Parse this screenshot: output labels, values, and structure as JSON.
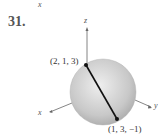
{
  "stray_label": "x",
  "problem_number": "31.",
  "axes": {
    "z": "z",
    "x": "x",
    "y": "y"
  },
  "points": [
    {
      "label": "(2, 1, 3)"
    },
    {
      "label": "(1, 3, −1)"
    }
  ]
}
